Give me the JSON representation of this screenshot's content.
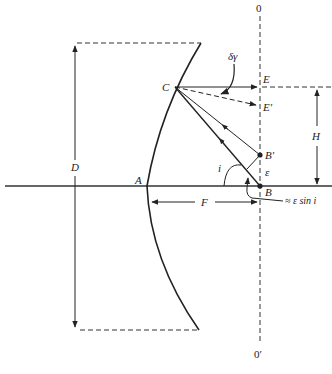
{
  "diagram": {
    "type": "optics-mirror-geometry",
    "labels": {
      "top_axis": "0",
      "bottom_axis": "0′",
      "C": "C",
      "E": "E",
      "E_prime": "E′",
      "A": "A",
      "B": "B",
      "B_prime": "B′",
      "D": "D",
      "F": "F",
      "H": "H",
      "i": "i",
      "epsilon": "ε",
      "delta_gamma": "δγ",
      "approx_label": "≈ ε sin i"
    },
    "colors": {
      "line": "#222222",
      "background": "#ffffff"
    }
  }
}
